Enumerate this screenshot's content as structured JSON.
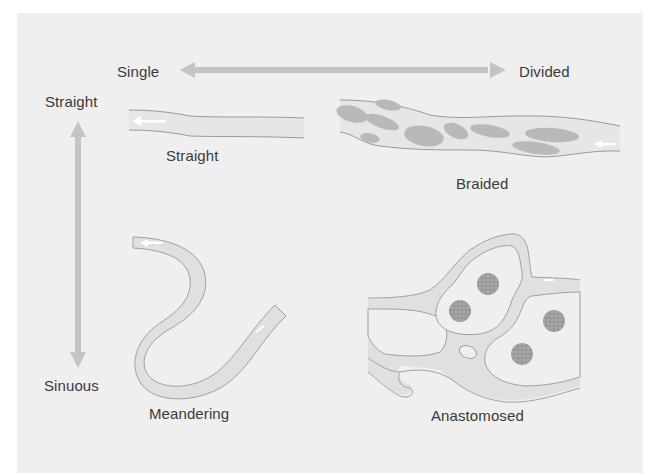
{
  "figure": {
    "type": "river-channel-pattern-classification",
    "colors": {
      "panel_background": "#efefef",
      "axis_arrow": "#c4c4c4",
      "channel_fill": "#e0e0e0",
      "channel_outline": "#9a9a9a",
      "bar_fill": "#b9b9b9",
      "vegetated_island": "#9c9c9c",
      "flow_arrow": "#ffffff",
      "text": "#3a3a3a"
    }
  },
  "axes": {
    "horizontal": {
      "left_label": "Single",
      "right_label": "Divided",
      "direction": "bidirectional"
    },
    "vertical": {
      "top_label": "Straight",
      "bottom_label": "Sinuous",
      "direction": "bidirectional"
    }
  },
  "patterns": [
    {
      "id": "straight",
      "label": "Straight",
      "position": "top-left",
      "channels": "single",
      "sinuosity": "straight"
    },
    {
      "id": "braided",
      "label": "Braided",
      "position": "top-right",
      "channels": "divided",
      "sinuosity": "straight"
    },
    {
      "id": "meandering",
      "label": "Meandering",
      "position": "bottom-left",
      "channels": "single",
      "sinuosity": "sinuous"
    },
    {
      "id": "anastomosed",
      "label": "Anastomosed",
      "position": "bottom-right",
      "channels": "divided",
      "sinuosity": "sinuous"
    }
  ]
}
